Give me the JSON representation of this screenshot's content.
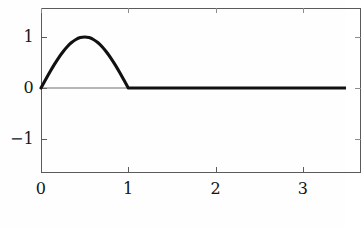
{
  "chart_data": {
    "type": "line",
    "title": "",
    "subtitle": "",
    "xlabel": "",
    "ylabel": "",
    "xlim": [
      0,
      3.5
    ],
    "ylim": [
      -1.62,
      1.62
    ],
    "xticks": [
      0,
      1,
      2,
      3
    ],
    "xtick_labels": [
      "0",
      "1",
      "2",
      "3"
    ],
    "yticks": [
      1,
      0,
      -1
    ],
    "ytick_labels": [
      "1",
      "0",
      "−1"
    ],
    "grid": false,
    "legend": null,
    "annotations": [],
    "series": [
      {
        "name": "half-sine pulse",
        "color": "#111111",
        "linewidth": 3.1,
        "description": "sin(pi*x) on 0<=x<=1, zero elsewhere",
        "x": [
          0,
          0.05,
          0.1,
          0.15,
          0.2,
          0.25,
          0.3,
          0.35,
          0.4,
          0.45,
          0.5,
          0.55,
          0.6,
          0.65,
          0.7,
          0.75,
          0.8,
          0.85,
          0.9,
          0.95,
          1,
          1.25,
          1.5,
          1.75,
          2,
          2.25,
          2.5,
          2.75,
          3,
          3.25,
          3.5
        ],
        "y": [
          0,
          0.156,
          0.309,
          0.454,
          0.588,
          0.707,
          0.809,
          0.891,
          0.951,
          0.988,
          1,
          0.988,
          0.951,
          0.891,
          0.809,
          0.707,
          0.588,
          0.454,
          0.309,
          0.156,
          0,
          0,
          0,
          0,
          0,
          0,
          0,
          0,
          0,
          0,
          0
        ]
      }
    ],
    "zero_line": {
      "name": "zero-axis",
      "value": 0,
      "color": "#6f6f6f"
    }
  },
  "figure": {
    "background_color": "#fefefe",
    "frame_color": "#5a5a5a",
    "tick_color": "#5a5a5a",
    "label_color": "#141414"
  }
}
